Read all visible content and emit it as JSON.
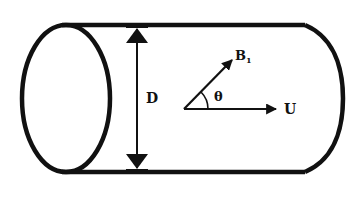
{
  "diagram": {
    "type": "cylinder-with-vectors",
    "colors": {
      "stroke": "#111111",
      "background": "#ffffff"
    },
    "labels": {
      "diameter": "D",
      "vector_b": "B",
      "vector_b_subscript": "1",
      "angle": "θ",
      "vector_u": "U"
    }
  }
}
